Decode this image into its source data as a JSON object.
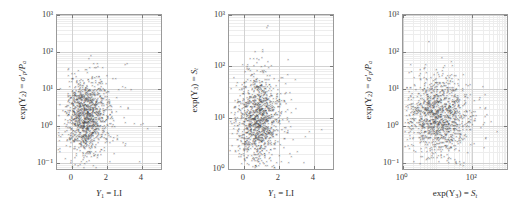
{
  "figure": {
    "type": "scatter-matrix",
    "panel_count": 3,
    "marker_glyph": "×",
    "marker_color": "#4a4a4a",
    "grid_color": "#d2d2d2",
    "frame_color": "#9a9a9a",
    "background": "#ffffff"
  },
  "chart_data": [
    {
      "type": "scatter",
      "id": "panel-1",
      "title": "",
      "xlabel": "Y1 = LI",
      "xlabel_parts": {
        "var": "Y",
        "sub": "1",
        "eq": " = ",
        "name": "LI"
      },
      "ylabel": "exp(Y2) = sigma'_p / Pa",
      "ylabel_parts": {
        "fn": "exp(Y",
        "sub": "2",
        "close": ") = ",
        "sym": "σ'",
        "symsub": "p",
        "div": "/P",
        "divsub": "a"
      },
      "xscale": "linear",
      "yscale": "log",
      "xlim": [
        -0.85,
        5.1
      ],
      "ylim": [
        0.07,
        1000
      ],
      "xticks": [
        0,
        2,
        4
      ],
      "xtick_labels": [
        "0",
        "2",
        "4"
      ],
      "yticks": [
        0.1,
        1,
        10,
        100,
        1000
      ],
      "ytick_labels": [
        "10⁻¹",
        "10⁰",
        "10¹",
        "10²",
        "10³"
      ],
      "grid": true,
      "legend": "none",
      "n_points": 1200,
      "cluster": {
        "x_center": 0.8,
        "x_spread": 0.62,
        "y_center_log": 0.28,
        "y_spread_log": 0.52
      }
    },
    {
      "type": "scatter",
      "id": "panel-2",
      "title": "",
      "xlabel": "Y1 = LI",
      "xlabel_parts": {
        "var": "Y",
        "sub": "1",
        "eq": " = ",
        "name": "LI"
      },
      "ylabel": "exp(Y3) = St",
      "ylabel_parts": {
        "fn": "exp(Y",
        "sub": "3",
        "close": ") = ",
        "sym": "S",
        "symsub": "t",
        "div": "",
        "divsub": ""
      },
      "xscale": "linear",
      "yscale": "log",
      "xlim": [
        -0.85,
        5.1
      ],
      "ylim": [
        1,
        1000
      ],
      "xticks": [
        0,
        2,
        4
      ],
      "xtick_labels": [
        "0",
        "2",
        "4"
      ],
      "yticks": [
        1,
        10,
        100,
        1000
      ],
      "ytick_labels": [
        "10⁰",
        "10¹",
        "10²",
        "10³"
      ],
      "grid": true,
      "legend": "none",
      "n_points": 1200,
      "cluster": {
        "x_center": 0.8,
        "x_spread": 0.62,
        "y_center_log": 1.0,
        "y_spread_log": 0.45
      }
    },
    {
      "type": "scatter",
      "id": "panel-3",
      "title": "",
      "xlabel": "exp(Y3) = St",
      "xlabel_parts": {
        "fn": "exp(Y",
        "sub": "3",
        "close": ") = ",
        "sym": "S",
        "symsub": "t"
      },
      "ylabel": "exp(Y2) = sigma'_p / Pa",
      "ylabel_parts": {
        "fn": "exp(Y",
        "sub": "2",
        "close": ") = ",
        "sym": "σ'",
        "symsub": "p",
        "div": "/P",
        "divsub": "a"
      },
      "xscale": "log",
      "yscale": "log",
      "xlim": [
        1,
        1000
      ],
      "ylim": [
        0.07,
        1000
      ],
      "xticks": [
        1,
        100
      ],
      "xtick_labels": [
        "10⁰",
        "10²"
      ],
      "yticks": [
        0.1,
        1,
        10,
        100,
        1000
      ],
      "ytick_labels": [
        "10⁻¹",
        "10⁰",
        "10¹",
        "10²",
        "10³"
      ],
      "grid": true,
      "legend": "none",
      "n_points": 1200,
      "cluster": {
        "x_center_log": 1.0,
        "x_spread_log": 0.45,
        "y_center_log": 0.28,
        "y_spread_log": 0.52
      }
    }
  ]
}
